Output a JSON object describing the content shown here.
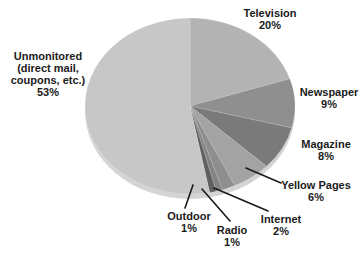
{
  "chart_data": {
    "type": "pie",
    "title": "",
    "unit": "%",
    "direction": "clockwise",
    "start_angle_deg": 0,
    "legend_position": "labels-around-pie",
    "rim_color": "#d4d4d4",
    "background_color": "#ffffff",
    "slices": [
      {
        "label": "Television",
        "value": 20,
        "pct_label": "20%",
        "color": "#b3b3b3"
      },
      {
        "label": "Newspaper",
        "value": 9,
        "pct_label": "9%",
        "color": "#8f8f8f"
      },
      {
        "label": "Magazine",
        "value": 8,
        "pct_label": "8%",
        "color": "#7a7a7a"
      },
      {
        "label": "Yellow Pages",
        "value": 6,
        "pct_label": "6%",
        "color": "#a3a3a3"
      },
      {
        "label": "Internet",
        "value": 2,
        "pct_label": "2%",
        "color": "#8e8e8e"
      },
      {
        "label": "Radio",
        "value": 1,
        "pct_label": "1%",
        "color": "#848484"
      },
      {
        "label": "Outdoor",
        "value": 1,
        "pct_label": "1%",
        "color": "#5f5f5f"
      },
      {
        "label": "Unmonitored (direct mail, coupons, etc.)",
        "value": 53,
        "pct_label": "53%",
        "color": "#c7c7c7"
      }
    ],
    "unmonitored_label_lines": [
      "Unmonitored",
      "(direct mail,",
      "coupons, etc.)",
      "53%"
    ]
  }
}
